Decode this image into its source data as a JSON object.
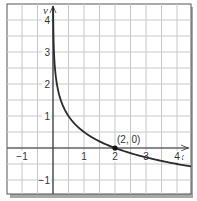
{
  "chart_data": {
    "type": "line",
    "title": "",
    "xlabel": "x",
    "ylabel": "y",
    "xlim": [
      -1.5,
      4.45
    ],
    "ylim": [
      -1.45,
      4.5
    ],
    "grid": true,
    "grid_step": 0.5,
    "x_ticks": [
      {
        "value": -1,
        "label": "−1"
      },
      {
        "value": 1,
        "label": "1"
      },
      {
        "value": 2,
        "label": "2"
      },
      {
        "value": 3,
        "label": "3"
      },
      {
        "value": 4,
        "label": "4"
      }
    ],
    "y_ticks": [
      {
        "value": 4,
        "label": "4"
      },
      {
        "value": 3,
        "label": "3"
      },
      {
        "value": 2,
        "label": "2"
      },
      {
        "value": 1,
        "label": "1"
      },
      {
        "value": -1,
        "label": "−1"
      }
    ],
    "series": [
      {
        "name": "curve",
        "function": "y = log_{1/4}(x/2)",
        "x": [
          0.016,
          0.03,
          0.0625,
          0.125,
          0.25,
          0.5,
          1,
          1.5,
          2,
          3,
          4,
          4.45
        ],
        "y": [
          3.5,
          3.03,
          2.5,
          2.0,
          1.5,
          1.0,
          0.5,
          0.21,
          0,
          -0.29,
          -0.5,
          -0.58
        ]
      }
    ],
    "annotations": [
      {
        "x": 2,
        "y": 0,
        "label": "(2, 0)",
        "marker": "point"
      }
    ],
    "colors": {
      "curve": "#2b2b2b",
      "grid": "#c8c8c8",
      "axis": "#333333",
      "frame": "#444444",
      "shadow": "#9a9a9a"
    }
  }
}
